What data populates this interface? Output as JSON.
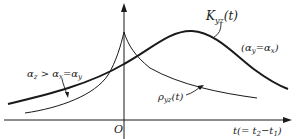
{
  "figure": {
    "type": "diagram",
    "axes": {
      "origin_label": "O",
      "x_axis_label": "t(= t",
      "x_axis_label_sub2": "2",
      "x_axis_label_mid": "−t",
      "x_axis_label_sub1": "1",
      "x_axis_label_end": ")"
    },
    "curves": [
      {
        "name": "K_yz(t)",
        "label_main": "K",
        "label_sub": "yz",
        "label_arg": "(t)",
        "style": "thick"
      },
      {
        "name": "rho_yz(t)",
        "label_main": "ρ",
        "label_sub": "yz",
        "label_arg": "(t)",
        "style": "thin"
      }
    ],
    "annotations": {
      "right_condition": {
        "open": "(α",
        "sub1": "y",
        "mid": "=α",
        "sub2": "x",
        "close": ")"
      },
      "left_condition": {
        "a": "α",
        "sub1": "z",
        "gt": " > α",
        "sub2": "x",
        "eq": "=α",
        "sub3": "y"
      }
    },
    "colors": {
      "line": "#1a1a1a",
      "background": "#ffffff"
    }
  }
}
